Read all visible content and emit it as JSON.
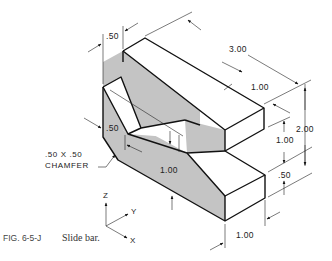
{
  "figure": {
    "id_label": "FIG. 6-5-J",
    "title": "Slide bar."
  },
  "dimensions": {
    "top_step_width": ".50",
    "overall_length": "3.00",
    "upper_block_depth": "1.00",
    "overall_height": "2.00",
    "upper_step_height": "1.00",
    "lower_step_height": ".50",
    "left_step_height": ".50",
    "front_face_length": "1.00",
    "bottom_depth": "1.00"
  },
  "notes": {
    "chamfer_line1": ".50 X .50",
    "chamfer_line2": "CHAMFER"
  },
  "axes": {
    "z": "Z",
    "y": "Y",
    "x": "X"
  },
  "colors": {
    "shaded_face": "#c4c4c4",
    "line": "#111111",
    "background": "#ffffff"
  }
}
